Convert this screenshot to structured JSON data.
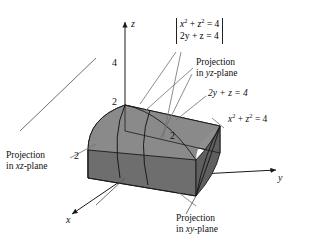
{
  "figure": {
    "kind": "3d-coordinate-diagram"
  },
  "axes": {
    "z_label": "z",
    "x_label": "x",
    "y_label": "y"
  },
  "ticks": {
    "z_four": "4",
    "z_two": "2",
    "x_two": "2",
    "y_two": "2"
  },
  "system": {
    "line1_a": "x",
    "line1_a_sup": "2",
    "line1_mid": " + ",
    "line1_b": "z",
    "line1_b_sup": "2",
    "line1_end": " = 4",
    "line2": "2y + z = 4"
  },
  "callouts": {
    "yz": {
      "line1": "Projection",
      "line2_pre": "in ",
      "line2_em": "yz",
      "line2_post": "-plane"
    },
    "xz": {
      "line1": "Projection",
      "line2_pre": "in ",
      "line2_em": "xz",
      "line2_post": "-plane"
    },
    "xy": {
      "line1": "Projection",
      "line2_pre": "in ",
      "line2_em": "xy",
      "line2_post": "-plane"
    }
  },
  "equations": {
    "plane": "2y + z = 4",
    "cylinder_pre": "x",
    "cylinder_sup1": "2",
    "cylinder_mid": " + ",
    "cylinder_b": "z",
    "cylinder_sup2": "2",
    "cylinder_end": " = 4"
  },
  "colors": {
    "background": "#ffffff",
    "stroke": "#1a1a1a",
    "leader": "#6f6f6f",
    "face_left_light": "#c3c3c3",
    "face_top_mid": "#8a8a8a",
    "face_front_dark": "#6e6e6e",
    "face_right_dark": "#5f5f5f",
    "text": "#111111"
  }
}
